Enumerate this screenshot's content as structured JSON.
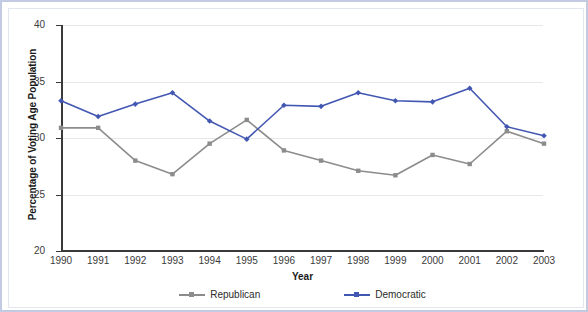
{
  "chart_data": {
    "type": "line",
    "title": "",
    "subtitle": "",
    "xlabel": "Year",
    "ylabel": "Percentage of Voting Age Population",
    "categories": [
      "1990",
      "1991",
      "1992",
      "1993",
      "1994",
      "1995",
      "1996",
      "1997",
      "1998",
      "1999",
      "2000",
      "2001",
      "2002",
      "2003"
    ],
    "x": [
      1990,
      1991,
      1992,
      1993,
      1994,
      1995,
      1996,
      1997,
      1998,
      1999,
      2000,
      2001,
      2002,
      2003
    ],
    "ylim": [
      20,
      40
    ],
    "yticks": [
      20,
      25,
      30,
      35,
      40
    ],
    "ytick_labels": [
      "20",
      "25",
      "30",
      "35",
      "40"
    ],
    "xlim": [
      1990,
      2003
    ],
    "grid": "horizontal",
    "legend_position": "bottom",
    "series": [
      {
        "name": "Republican",
        "color": "#8c8c8c",
        "marker": "square",
        "values": [
          30.9,
          30.9,
          28.0,
          26.8,
          29.5,
          31.6,
          28.9,
          28.0,
          27.1,
          26.7,
          28.5,
          27.7,
          30.6,
          29.5
        ]
      },
      {
        "name": "Democratic",
        "color": "#4257b2",
        "marker": "diamond",
        "values": [
          33.3,
          31.9,
          33.0,
          34.0,
          31.5,
          29.9,
          32.9,
          32.8,
          34.0,
          33.3,
          33.2,
          34.4,
          31.0,
          30.2
        ]
      }
    ]
  },
  "legend": {
    "items": [
      {
        "label": "Republican",
        "color": "#8c8c8c"
      },
      {
        "label": "Democratic",
        "color": "#4257b2"
      }
    ]
  },
  "axes": {
    "y_title": "Percentage of Voting Age Population",
    "x_title": "Year"
  },
  "colors": {
    "republican": "#8c8c8c",
    "democratic": "#4257b2",
    "gridline": "#e8e8ec",
    "axis": "#3a3a3a",
    "frame_border": "#c3cbe2",
    "panel_background": "#ffffff"
  }
}
